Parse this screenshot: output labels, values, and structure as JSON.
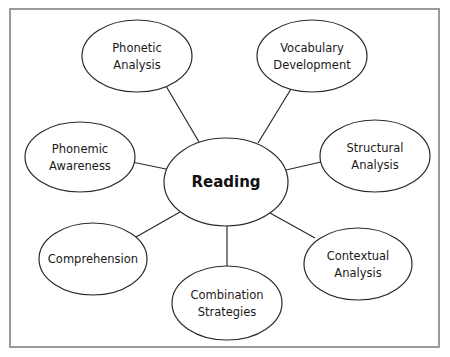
{
  "diagram": {
    "type": "concept-map",
    "center": {
      "label": "Reading",
      "cx": 226,
      "cy": 182,
      "rx": 62,
      "ry": 44
    },
    "nodes": [
      {
        "id": "phonetic",
        "lines": [
          "Phonetic",
          "Analysis"
        ],
        "cx": 137,
        "cy": 56,
        "rx": 55,
        "ry": 36
      },
      {
        "id": "vocabulary",
        "lines": [
          "Vocabulary",
          "Development"
        ],
        "cx": 312,
        "cy": 56,
        "rx": 55,
        "ry": 36
      },
      {
        "id": "phonemic",
        "lines": [
          "Phonemic",
          "Awareness"
        ],
        "cx": 80,
        "cy": 157,
        "rx": 55,
        "ry": 35
      },
      {
        "id": "structural",
        "lines": [
          "Structural",
          "Analysis"
        ],
        "cx": 375,
        "cy": 156,
        "rx": 55,
        "ry": 36
      },
      {
        "id": "comprehension",
        "lines": [
          "Comprehension"
        ],
        "cx": 93,
        "cy": 259,
        "rx": 54,
        "ry": 36
      },
      {
        "id": "combination",
        "lines": [
          "Combination",
          "Strategies"
        ],
        "cx": 227,
        "cy": 303,
        "rx": 55,
        "ry": 37
      },
      {
        "id": "contextual",
        "lines": [
          "Contextual",
          "Analysis"
        ],
        "cx": 358,
        "cy": 264,
        "rx": 54,
        "ry": 36
      }
    ],
    "edges": [
      {
        "from": "phonetic",
        "x1": 166,
        "y1": 86,
        "x2": 199,
        "y2": 142
      },
      {
        "from": "vocabulary",
        "x1": 291,
        "y1": 89,
        "x2": 258,
        "y2": 143
      },
      {
        "from": "phonemic",
        "x1": 132,
        "y1": 162,
        "x2": 166,
        "y2": 169
      },
      {
        "from": "structural",
        "x1": 321,
        "y1": 162,
        "x2": 286,
        "y2": 170
      },
      {
        "from": "comprehension",
        "x1": 136,
        "y1": 237,
        "x2": 180,
        "y2": 212
      },
      {
        "from": "combination",
        "x1": 227,
        "y1": 266,
        "x2": 227,
        "y2": 226
      },
      {
        "from": "contextual",
        "x1": 315,
        "y1": 238,
        "x2": 270,
        "y2": 213
      }
    ],
    "colors": {
      "stroke": "#2a2a2a",
      "border": "#9a9a9a",
      "background": "#ffffff"
    }
  }
}
